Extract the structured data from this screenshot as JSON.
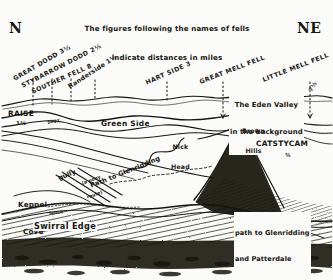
{
  "diagram": {
    "caption_line1": "The figures following the names of fells",
    "caption_line2": "indicate distances in miles",
    "ink_color": "#17150f",
    "paper_color": "#fbfbfa"
  },
  "compass": {
    "left_label": "N",
    "right_label": "NE"
  },
  "skyline_fells": [
    {
      "name": "GREAT DODD",
      "distance": "3½",
      "label": "GREAT DODD 3½"
    },
    {
      "name": "STYBARROW DODD",
      "distance": "2½",
      "label": "STYBARROW DODD 2½"
    },
    {
      "name": "SOUTHER FELL",
      "distance": "8",
      "label": "SOUTHER FELL 8"
    },
    {
      "name": "Randerside",
      "distance": "1½",
      "label": "Randerside 1½"
    },
    {
      "name": "HART SIDE",
      "distance": "3",
      "label": "HART SIDE 3"
    },
    {
      "name": "GREAT MELL FELL",
      "distance": "",
      "label": "GREAT MELL FELL"
    },
    {
      "name": "LITTLE MELL FELL",
      "distance": "7½",
      "label": "LITTLE MELL FELL"
    }
  ],
  "distance_markers": [
    {
      "for": "LITTLE MELL FELL",
      "value": "7½"
    },
    {
      "for": "RAISE",
      "value": "1½"
    },
    {
      "for": "CATSTYCAM",
      "value": "¾"
    }
  ],
  "foreground_features": [
    {
      "name": "RAISE",
      "label": "RAISE"
    },
    {
      "name": "Green Side",
      "label": "Green Side"
    },
    {
      "name": "Brown Hills",
      "label": "Brown\nHills"
    },
    {
      "name": "Nick Head",
      "label": "Nick\nHead"
    },
    {
      "name": "CATSTYCAM",
      "label": "CATSTYCAM"
    },
    {
      "name": "Keppel Cove",
      "label": "Keppel\nCove"
    },
    {
      "name": "Swirral Edge",
      "label": "Swirral Edge"
    }
  ],
  "annotations": {
    "eden_valley": "The Eden Valley\nin the background",
    "path_glenridding": "Path to Glenridding",
    "pony_route": "(a pony\nroute)",
    "gully": "gully",
    "path_glenridding_patterdale": "path to Glenridding\nand Patterdale",
    "fence_note": "fence\n(dry)",
    "col_note": "1007"
  }
}
